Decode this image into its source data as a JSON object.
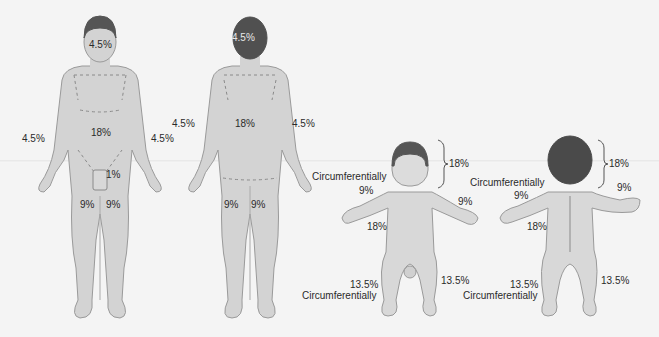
{
  "diagram": {
    "colors": {
      "background": "#f4f4f4",
      "skin": "#d3d3d3",
      "skin_outline": "#9a9a9a",
      "hair": "#555555",
      "child_back_hair": "#4a4a4a",
      "text": "#2a2a2a"
    },
    "adult_front": {
      "head": "4.5%",
      "left_arm": "4.5%",
      "right_arm": "4.5%",
      "trunk": "18%",
      "genitalia": "1%",
      "left_leg": "9%",
      "right_leg": "9%"
    },
    "adult_back": {
      "head": "4.5%",
      "left_arm": "4.5%",
      "right_arm": "4.5%",
      "trunk": "18%",
      "left_leg": "9%",
      "right_leg": "9%"
    },
    "child_front": {
      "head_bracket": "18%",
      "head_note": "Circumferentially",
      "left_arm": "9%",
      "right_arm": "9%",
      "trunk": "18%",
      "left_leg": "13.5%",
      "leg_note": "Circumferentially",
      "right_leg": "13.5%"
    },
    "child_back": {
      "head_bracket": "18%",
      "head_note": "Circumferentially",
      "left_arm": "9%",
      "right_arm": "9%",
      "trunk": "18%",
      "left_leg": "13.5%",
      "leg_note": "Circumferentially",
      "right_leg": "13.5%"
    }
  }
}
